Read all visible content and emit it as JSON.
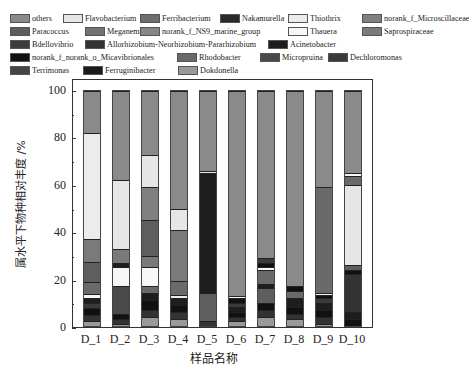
{
  "chart_data": {
    "type": "bar",
    "stacked": true,
    "title": "",
    "xlabel": "样品名称",
    "ylabel": "属水平下物种相对丰度 /%",
    "ylim": [
      0,
      100
    ],
    "yticks": [
      0,
      20,
      40,
      60,
      80,
      100
    ],
    "categories": [
      "D_1",
      "D_2",
      "D_3",
      "D_4",
      "D_5",
      "D_6",
      "D_7",
      "D_8",
      "D_9",
      "D_10"
    ],
    "legend": [
      {
        "name": "others",
        "color": "#8a8a8a"
      },
      {
        "name": "Flavobacterium",
        "color": "#e6e6e6"
      },
      {
        "name": "Ferribacterium",
        "color": "#6e6e6e"
      },
      {
        "name": "Nakamurella",
        "color": "#2a2a2a"
      },
      {
        "name": "Thiothrix",
        "color": "#ececec"
      },
      {
        "name": "norank_f_Microscillaceae",
        "color": "#808080"
      },
      {
        "name": "Paracoccus",
        "color": "#5e5e5e"
      },
      {
        "name": "Meganema",
        "color": "#737373"
      },
      {
        "name": "norank_f_NS9_marine_group",
        "color": "#858585"
      },
      {
        "name": "Thauera",
        "color": "#f7f7f7"
      },
      {
        "name": "Saprospiraceae",
        "color": "#7a7a7a"
      },
      {
        "name": "Bdellovibrio",
        "color": "#3c3c3c"
      },
      {
        "name": "Allorhizobium-Neorhizobium-Pararhizobium",
        "color": "#333333"
      },
      {
        "name": "Acinetobacter",
        "color": "#1e1e1e"
      },
      {
        "name": "norank_f_norank_o_Micavibrionales",
        "color": "#111111"
      },
      {
        "name": "Rhodobacter",
        "color": "#6a6a6a"
      },
      {
        "name": "Micropruina",
        "color": "#4a4a4a"
      },
      {
        "name": "Dechloromonas",
        "color": "#3a3a3a"
      },
      {
        "name": "Terrimonas",
        "color": "#444444"
      },
      {
        "name": "Ferruginibacter",
        "color": "#1a1a1a"
      },
      {
        "name": "Dokdonella",
        "color": "#9a9a9a"
      }
    ],
    "series_by_sample_bottom_to_top": {
      "D_1": [
        {
          "c": "#9a9a9a",
          "v": 2
        },
        {
          "c": "#333333",
          "v": 3
        },
        {
          "c": "#111111",
          "v": 3
        },
        {
          "c": "#3a3a3a",
          "v": 2
        },
        {
          "c": "#1e1e1e",
          "v": 2
        },
        {
          "c": "#f7f7f7",
          "v": 2
        },
        {
          "c": "#6a6a6a",
          "v": 5
        },
        {
          "c": "#5e5e5e",
          "v": 9
        },
        {
          "c": "#7a7a7a",
          "v": 10
        },
        {
          "c": "#ececec",
          "v": 46
        },
        {
          "c": "#8a8a8a",
          "v": 18
        }
      ],
      "D_2": [
        {
          "c": "#9a9a9a",
          "v": 1
        },
        {
          "c": "#333333",
          "v": 2
        },
        {
          "c": "#111111",
          "v": 2
        },
        {
          "c": "#4a4a4a",
          "v": 12
        },
        {
          "c": "#f7f7f7",
          "v": 8
        },
        {
          "c": "#1e1e1e",
          "v": 2
        },
        {
          "c": "#7a7a7a",
          "v": 6
        },
        {
          "c": "#e6e6e6",
          "v": 29
        },
        {
          "c": "#8a8a8a",
          "v": 38
        }
      ],
      "D_3": [
        {
          "c": "#9a9a9a",
          "v": 4
        },
        {
          "c": "#333333",
          "v": 3
        },
        {
          "c": "#111111",
          "v": 4
        },
        {
          "c": "#1e1e1e",
          "v": 3
        },
        {
          "c": "#6a6a6a",
          "v": 3
        },
        {
          "c": "#f7f7f7",
          "v": 8
        },
        {
          "c": "#7a7a7a",
          "v": 5
        },
        {
          "c": "#5e5e5e",
          "v": 15
        },
        {
          "c": "#808080",
          "v": 14
        },
        {
          "c": "#e6e6e6",
          "v": 14
        },
        {
          "c": "#8a8a8a",
          "v": 27
        }
      ],
      "D_4": [
        {
          "c": "#9a9a9a",
          "v": 3
        },
        {
          "c": "#333333",
          "v": 3
        },
        {
          "c": "#111111",
          "v": 3
        },
        {
          "c": "#1e1e1e",
          "v": 3
        },
        {
          "c": "#ececec",
          "v": 1
        },
        {
          "c": "#6a6a6a",
          "v": 6
        },
        {
          "c": "#7a7a7a",
          "v": 22
        },
        {
          "c": "#e6e6e6",
          "v": 9
        },
        {
          "c": "#8a8a8a",
          "v": 50
        }
      ],
      "D_5": [
        {
          "c": "#333333",
          "v": 2
        },
        {
          "c": "#5e5e5e",
          "v": 12
        },
        {
          "c": "#1e1e1e",
          "v": 51
        },
        {
          "c": "#ececec",
          "v": 1
        },
        {
          "c": "#8a8a8a",
          "v": 34
        }
      ],
      "D_6": [
        {
          "c": "#9a9a9a",
          "v": 2
        },
        {
          "c": "#333333",
          "v": 2
        },
        {
          "c": "#111111",
          "v": 2
        },
        {
          "c": "#1e1e1e",
          "v": 2
        },
        {
          "c": "#3a3a3a",
          "v": 2
        },
        {
          "c": "#111111",
          "v": 2
        },
        {
          "c": "#f7f7f7",
          "v": 1
        },
        {
          "c": "#8a8a8a",
          "v": 87
        }
      ],
      "D_7": [
        {
          "c": "#9a9a9a",
          "v": 4
        },
        {
          "c": "#333333",
          "v": 3
        },
        {
          "c": "#111111",
          "v": 3
        },
        {
          "c": "#5e5e5e",
          "v": 6
        },
        {
          "c": "#1e1e1e",
          "v": 2
        },
        {
          "c": "#6a6a6a",
          "v": 6
        },
        {
          "c": "#f7f7f7",
          "v": 1
        },
        {
          "c": "#111111",
          "v": 2
        },
        {
          "c": "#3a3a3a",
          "v": 2
        },
        {
          "c": "#8a8a8a",
          "v": 71
        }
      ],
      "D_8": [
        {
          "c": "#9a9a9a",
          "v": 3
        },
        {
          "c": "#333333",
          "v": 2
        },
        {
          "c": "#111111",
          "v": 3
        },
        {
          "c": "#1e1e1e",
          "v": 4
        },
        {
          "c": "#6a6a6a",
          "v": 3
        },
        {
          "c": "#111111",
          "v": 2
        },
        {
          "c": "#8a8a8a",
          "v": 83
        }
      ],
      "D_9": [
        {
          "c": "#9a9a9a",
          "v": 1
        },
        {
          "c": "#333333",
          "v": 3
        },
        {
          "c": "#111111",
          "v": 3
        },
        {
          "c": "#1e1e1e",
          "v": 3
        },
        {
          "c": "#3a3a3a",
          "v": 2
        },
        {
          "c": "#111111",
          "v": 1
        },
        {
          "c": "#f7f7f7",
          "v": 1
        },
        {
          "c": "#6a6a6a",
          "v": 45
        },
        {
          "c": "#8a8a8a",
          "v": 41
        }
      ],
      "D_10": [
        {
          "c": "#111111",
          "v": 3
        },
        {
          "c": "#1e1e1e",
          "v": 3
        },
        {
          "c": "#333333",
          "v": 16
        },
        {
          "c": "#111111",
          "v": 2
        },
        {
          "c": "#5e5e5e",
          "v": 2
        },
        {
          "c": "#e6e6e6",
          "v": 34
        },
        {
          "c": "#6a6a6a",
          "v": 4
        },
        {
          "c": "#f7f7f7",
          "v": 1
        },
        {
          "c": "#8a8a8a",
          "v": 35
        }
      ]
    }
  }
}
